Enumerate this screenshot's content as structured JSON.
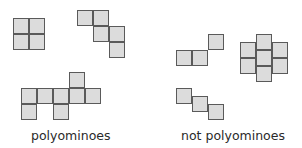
{
  "colors": {
    "cell_fill": "#dcdcdc",
    "cell_border": "#5a5a5a",
    "text": "#2a2a2a"
  },
  "labels": {
    "polyominoes": "polyominoes",
    "not_polyominoes": "not polyominoes"
  },
  "groups": [
    {
      "label": "polyominoes",
      "shapes": [
        {
          "name": "square-tetromino",
          "cells": [
            [
              13,
              18
            ],
            [
              29,
              18
            ],
            [
              13,
              34
            ],
            [
              29,
              34
            ]
          ]
        },
        {
          "name": "s-pentomino",
          "cells": [
            [
              77,
              10
            ],
            [
              93,
              10
            ],
            [
              93,
              26
            ],
            [
              109,
              26
            ],
            [
              109,
              42
            ]
          ]
        },
        {
          "name": "heptomino",
          "cells": [
            [
              69,
              72
            ],
            [
              21,
              88
            ],
            [
              37,
              88
            ],
            [
              53,
              88
            ],
            [
              69,
              88
            ],
            [
              85,
              88
            ],
            [
              21,
              104
            ],
            [
              53,
              104
            ]
          ]
        }
      ]
    },
    {
      "label": "not polyominoes",
      "shapes": [
        {
          "name": "corner-touching-shape",
          "cells": [
            [
              176,
              50
            ],
            [
              192,
              50
            ],
            [
              208,
              34
            ]
          ]
        },
        {
          "name": "offset-cluster",
          "cells": [
            [
              256,
              34
            ],
            [
              256,
              50
            ],
            [
              256,
              66
            ],
            [
              240,
              42
            ],
            [
              240,
              58
            ],
            [
              272,
              42
            ],
            [
              272,
              58
            ]
          ]
        },
        {
          "name": "half-offset-staircase",
          "cells": [
            [
              176,
              88
            ],
            [
              192,
              96
            ],
            [
              208,
              104
            ]
          ]
        }
      ]
    }
  ]
}
